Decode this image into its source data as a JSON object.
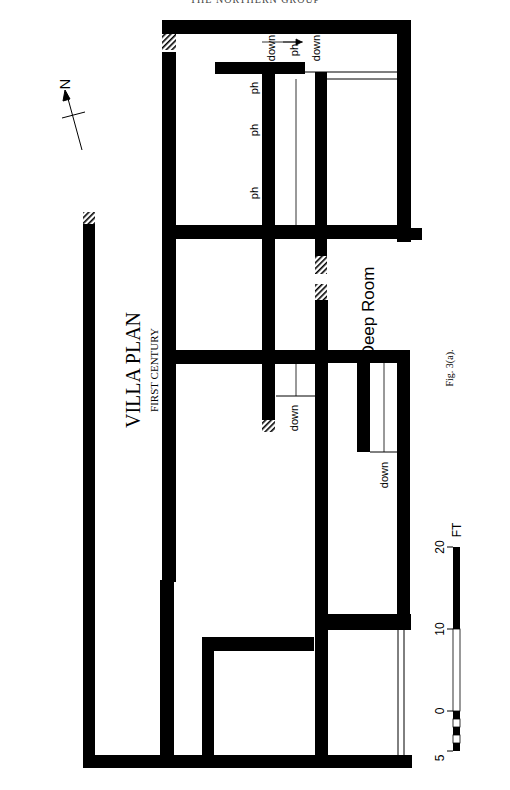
{
  "page": {
    "running_head": "THE NORTHERN GROUP",
    "caption": "Fig. 3(a)."
  },
  "plan": {
    "title": "VILLA PLAN",
    "subtitle": "FIRST CENTURY",
    "north_label": "N",
    "room_label": "Deep Room",
    "labels": {
      "down_1": "down",
      "down_2": "down",
      "down_3": "down",
      "down_4": "down",
      "ph_1": "ph",
      "ph_2": "ph",
      "ph_3": "ph",
      "ph_4": "ph"
    }
  },
  "scale_bar": {
    "unit": "FT",
    "ticks": [
      "5",
      "0",
      "10",
      "20"
    ]
  },
  "colors": {
    "wall": "#000000",
    "paper": "#ffffff",
    "hatch": "#000000"
  }
}
